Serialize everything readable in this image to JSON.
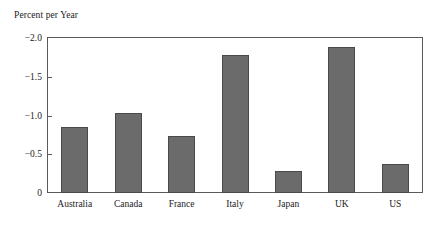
{
  "chart_data": {
    "type": "bar",
    "title": "Percent per Year",
    "xlabel": "",
    "ylabel": "Percent per Year",
    "categories": [
      "Australia",
      "Canada",
      "France",
      "Italy",
      "Japan",
      "UK",
      "US"
    ],
    "values": [
      -0.85,
      -1.03,
      -0.74,
      -1.78,
      -0.29,
      -1.88,
      -0.38
    ],
    "ytick_labels": [
      "−2.0",
      "−1.5",
      "−1.0",
      "−0.5",
      "0"
    ],
    "ytick_values": [
      -2.0,
      -1.5,
      -1.0,
      -0.5,
      0
    ],
    "ylim": [
      0,
      -2.0
    ],
    "y_axis_inverted": true,
    "grid": false,
    "legend": null,
    "bar_color": "#6b6b6b",
    "bar_edge_color": "#4a4a4a",
    "frame_color": "#5a5a5a",
    "background_color": "#ffffff"
  }
}
